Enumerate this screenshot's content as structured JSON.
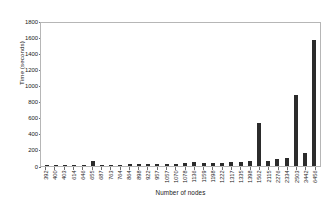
{
  "chart_data": {
    "type": "bar",
    "title": "",
    "xlabel": "Number of nodes",
    "ylabel": "Time (seconds)",
    "ylim": [
      0,
      1800
    ],
    "ytick_values": [
      0,
      200,
      400,
      600,
      800,
      1000,
      1200,
      1400,
      1600,
      1800
    ],
    "ytick_labels": [
      "0",
      "200",
      "400",
      "600",
      "800",
      "1000",
      "1200",
      "1400",
      "1600",
      "1800"
    ],
    "grid": false,
    "legend": null,
    "bar_color": "#2b2b2b",
    "axis_color": "#b6b6b6",
    "categories": [
      "392",
      "400",
      "403",
      "614",
      "646",
      "655",
      "687",
      "763",
      "764",
      "864",
      "898",
      "922",
      "957",
      "1057",
      "1070",
      "1078",
      "1136",
      "1159",
      "1198",
      "1222",
      "1317",
      "1335",
      "1398",
      "1562",
      "2115",
      "2276",
      "2334",
      "2503",
      "3442",
      "6456"
    ],
    "values": [
      3,
      4,
      5,
      6,
      9,
      62,
      10,
      11,
      12,
      13,
      14,
      16,
      18,
      22,
      24,
      26,
      40,
      28,
      34,
      30,
      46,
      38,
      60,
      530,
      58,
      80,
      96,
      890,
      160,
      1580
    ]
  }
}
